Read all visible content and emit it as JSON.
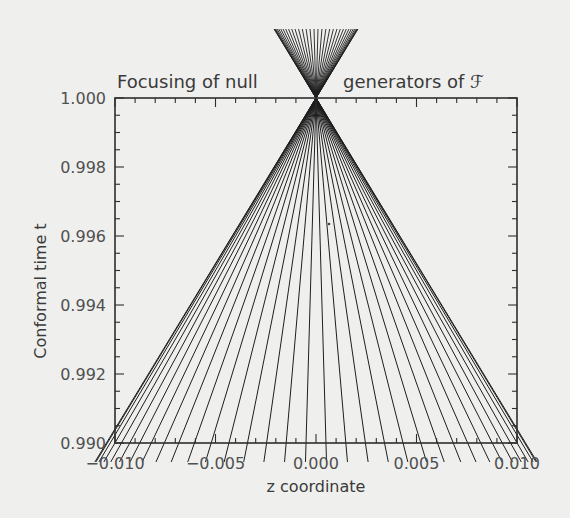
{
  "chart_data": {
    "type": "line",
    "title": "Focusing of null generators of ℱ",
    "xlabel": "z coordinate",
    "ylabel": "Conformal time t",
    "xlim": [
      -0.01,
      0.01
    ],
    "ylim": [
      0.99,
      1.0
    ],
    "x_ticks": [
      -0.01,
      -0.005,
      0.0,
      0.005,
      0.01
    ],
    "x_tick_labels": [
      "−0.010",
      "−0.005",
      "0.000",
      "0.005",
      "0.010"
    ],
    "x_minor_step": 0.001,
    "y_ticks": [
      0.99,
      0.992,
      0.994,
      0.996,
      0.998,
      1.0
    ],
    "y_tick_labels": [
      "0.990",
      "0.992",
      "0.994",
      "0.996",
      "0.998",
      "1.000"
    ],
    "y_minor_step": 0.0005,
    "grid": false,
    "legend": null,
    "focus_point": {
      "z": 0.0,
      "t": 1.0
    },
    "series": {
      "name": "null generators",
      "count": 34,
      "line_start_t": 0.98945,
      "line_end_t": 1.002,
      "z_at_start_formula": "0.011 * sin(phi), phi uniformly spaced in [-pi/2, pi/2]",
      "z_at_start": [
        -0.011,
        -0.01091,
        -0.01062,
        -0.01015,
        -0.00951,
        -0.00872,
        -0.00778,
        -0.00672,
        -0.00556,
        -0.00431,
        -0.00301,
        -0.00166,
        -0.00028,
        0.0011,
        0.00247,
        0.00381,
        0.00509,
        0.00629,
        0.00739,
        0.00838,
        0.00922,
        0.00992,
        0.01046,
        0.01083,
        0.011,
        -0.00097,
        0.00028,
        0.00166,
        0.00301,
        0.00431,
        0.00556,
        0.00672,
        0.00778,
        0.00872
      ]
    }
  },
  "figure": {
    "title_part1": "Focusing of null",
    "title_part2": "generators of ℱ",
    "xlabel": "z coordinate",
    "ylabel": "Conformal time t",
    "colors": {
      "background": "#efefee",
      "ink": "#2e2e2e",
      "text": "#3a3a3a"
    }
  }
}
